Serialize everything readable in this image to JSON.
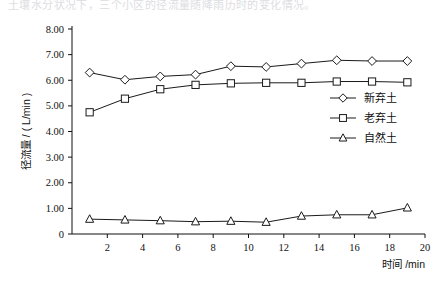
{
  "top_fragment": "土壤水分状况下，三个小区的径流量随降雨历时的变化情况。",
  "chart_data": {
    "type": "line",
    "title": "",
    "xlabel": "时间 /min",
    "ylabel": "径流量 / ( L/min )",
    "x": [
      1,
      3,
      5,
      7,
      9,
      11,
      13,
      15,
      17,
      19
    ],
    "xlim": [
      0,
      20
    ],
    "ylim": [
      0,
      8
    ],
    "xticks": [
      2,
      4,
      6,
      8,
      10,
      12,
      14,
      16,
      18,
      20
    ],
    "xtick_labels": [
      "2",
      "4",
      "6",
      "8",
      "10",
      "12",
      "14",
      "16",
      "18",
      "20"
    ],
    "yticks": [
      0,
      1,
      2,
      3,
      4,
      5,
      6,
      7,
      8
    ],
    "ytick_labels": [
      "0",
      "1.00",
      "2.00",
      "3.00",
      "4.00",
      "5.00",
      "6.00",
      "7.00",
      "8.00"
    ],
    "grid": false,
    "legend_position": "center-right",
    "series": [
      {
        "name": "新弃土",
        "marker": "diamond",
        "values": [
          6.3,
          6.02,
          6.15,
          6.22,
          6.55,
          6.52,
          6.65,
          6.78,
          6.75,
          6.75
        ]
      },
      {
        "name": "老弃土",
        "marker": "square",
        "values": [
          4.75,
          5.28,
          5.65,
          5.82,
          5.88,
          5.9,
          5.9,
          5.95,
          5.95,
          5.92
        ]
      },
      {
        "name": "自然土",
        "marker": "triangle",
        "values": [
          0.58,
          0.55,
          0.52,
          0.48,
          0.5,
          0.46,
          0.7,
          0.75,
          0.75,
          1.02
        ]
      }
    ]
  },
  "colors": {
    "line": "#1a1a1a",
    "marker_fill": "#ffffff",
    "axis": "#111111",
    "background": "#ffffff"
  }
}
